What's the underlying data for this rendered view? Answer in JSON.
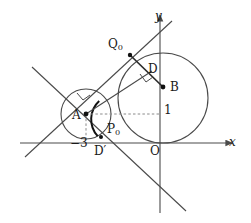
{
  "figure": {
    "type": "geometry-diagram",
    "background": "#ffffff",
    "stroke_color": "#4a4a4a",
    "text_color": "#1a1a1a"
  },
  "axes": {
    "origin": {
      "x": 160,
      "y": 143
    },
    "x_axis": {
      "label": "x",
      "label_style": "italic",
      "x1": 20,
      "y1": 143,
      "x2": 232,
      "y2": 143,
      "arrow": true
    },
    "y_axis": {
      "label": "y",
      "label_style": "italic",
      "x1": 160,
      "y1": 213,
      "x2": 160,
      "y2": 14,
      "arrow": true
    }
  },
  "circles": [
    {
      "name": "circle-B",
      "cx": 163,
      "cy": 98,
      "r": 45,
      "center_point": "B",
      "role": "large-circle"
    },
    {
      "name": "circle-A",
      "cx": 86,
      "cy": 114,
      "r": 25,
      "center_point": "A",
      "role": "small-circle"
    }
  ],
  "points": [
    {
      "name": "A",
      "label": "A",
      "x": 86,
      "y": 114,
      "dot": true,
      "label_x": 74,
      "label_y": 110
    },
    {
      "name": "B",
      "label": "B",
      "x": 163,
      "y": 87,
      "dot": true,
      "label_x": 170,
      "label_y": 82
    },
    {
      "name": "Q0",
      "label": "Q",
      "sub": "0",
      "x": 130,
      "y": 55,
      "dot": true,
      "label_x": 109,
      "label_y": 40
    },
    {
      "name": "P0",
      "label": "P",
      "sub": "0",
      "x": 103,
      "y": 136,
      "dot": true,
      "label_x": 108,
      "label_y": 124
    },
    {
      "name": "D",
      "label": "D",
      "x": 150,
      "y": 73,
      "dot": false,
      "label_x": 149,
      "label_y": 64
    },
    {
      "name": "Dprime",
      "label": "D′",
      "x": 100,
      "y": 145,
      "dot": false,
      "label_x": 96,
      "label_y": 146
    }
  ],
  "tick_labels": [
    {
      "name": "neg-three",
      "text": "−3",
      "x": 71,
      "y": 144
    },
    {
      "name": "one",
      "text": "1",
      "x": 164,
      "y": 104
    }
  ],
  "lines": [
    {
      "name": "tangent-line-upper",
      "x1": 25,
      "y1": 157,
      "x2": 172,
      "y2": 21,
      "style": "solid"
    },
    {
      "name": "tangent-line-lower",
      "x1": 32,
      "y1": 67,
      "x2": 186,
      "y2": 211,
      "style": "solid"
    },
    {
      "name": "segment-Q0-B",
      "x1": 130,
      "y1": 55,
      "x2": 163,
      "y2": 87,
      "style": "solid-thick"
    },
    {
      "name": "segment-A-Q0-extended",
      "x1": 86,
      "y1": 114,
      "x2": 150,
      "y2": 73,
      "style": "solid"
    },
    {
      "name": "segment-A-B-dashed",
      "x1": 86,
      "y1": 114,
      "x2": 160,
      "y2": 114,
      "style": "dashed"
    },
    {
      "name": "segment-A-foot-dashed",
      "x1": 86,
      "y1": 114,
      "x2": 86,
      "y2": 143,
      "style": "dashed"
    }
  ],
  "right_angle_marks": [
    {
      "name": "right-angle-at-D",
      "x": 145,
      "y": 78,
      "rotation": -38
    },
    {
      "name": "right-angle-near-A",
      "x": 83,
      "y": 96,
      "rotation": -38
    }
  ],
  "arcs": [
    {
      "name": "highlight-arc-on-circle-A",
      "cx": 86,
      "cy": 114,
      "r": 25,
      "start_deg": -62,
      "end_deg": 58,
      "emphasis": true
    }
  ]
}
